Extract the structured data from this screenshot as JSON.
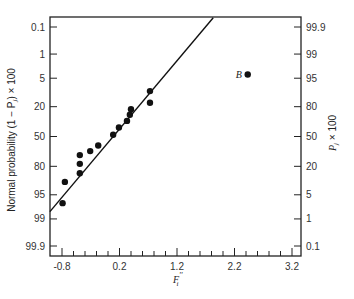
{
  "chart_data": {
    "type": "scatter",
    "title": "",
    "xlabel": "F_i''",
    "ylabel_left": "Normal probability (1 − P_j) × 100",
    "ylabel_right": "P_j × 100",
    "xlim": [
      -1.0,
      3.4
    ],
    "x_ticks": [
      -0.8,
      0.2,
      1.2,
      2.2,
      3.2
    ],
    "x_tick_labels": [
      "-0.8",
      "0.2",
      "1.2",
      "2.2",
      "3.2"
    ],
    "x_minor_step": 0.2,
    "y_scale": "normal-probability",
    "y_left_ticks": [
      "0.1",
      "1",
      "5",
      "20",
      "50",
      "80",
      "95",
      "99",
      "99.9"
    ],
    "y_right_ticks": [
      "99.9",
      "99",
      "95",
      "80",
      "50",
      "20",
      "5",
      "1",
      "0.1"
    ],
    "grid": false,
    "legend": null,
    "series": [
      {
        "name": "observations",
        "points": [
          {
            "x": -0.79,
            "y_left": 97
          },
          {
            "x": -0.75,
            "y_left": 90
          },
          {
            "x": -0.49,
            "y_left": 85
          },
          {
            "x": -0.49,
            "y_left": 78
          },
          {
            "x": -0.49,
            "y_left": 70
          },
          {
            "x": -0.31,
            "y_left": 66
          },
          {
            "x": -0.17,
            "y_left": 60
          },
          {
            "x": 0.09,
            "y_left": 48
          },
          {
            "x": 0.19,
            "y_left": 40
          },
          {
            "x": 0.33,
            "y_left": 33
          },
          {
            "x": 0.38,
            "y_left": 27
          },
          {
            "x": 0.4,
            "y_left": 22
          },
          {
            "x": 0.73,
            "y_left": 17
          },
          {
            "x": 0.73,
            "y_left": 10
          }
        ]
      },
      {
        "name": "outlier",
        "label": "B",
        "points": [
          {
            "x": 2.43,
            "y_left": 4
          }
        ]
      }
    ],
    "fit_line": {
      "from": {
        "x": -1.01,
        "y_left": 98.3
      },
      "to": {
        "x": 1.83,
        "y_left": 0.04
      }
    },
    "annotations": [
      {
        "text": "B",
        "x": 2.43,
        "y_left": 4
      }
    ]
  },
  "labels": {
    "xlabel_main": "F",
    "xlabel_sub": "i",
    "xlabel_sup": "''",
    "left_axis": "Normal probability (1 − P",
    "left_axis_sub": "j",
    "left_axis_tail": ") × 100",
    "right_axis": "P",
    "right_axis_sub": "j",
    "right_axis_tail": " × 100",
    "outlier_label": "B"
  }
}
